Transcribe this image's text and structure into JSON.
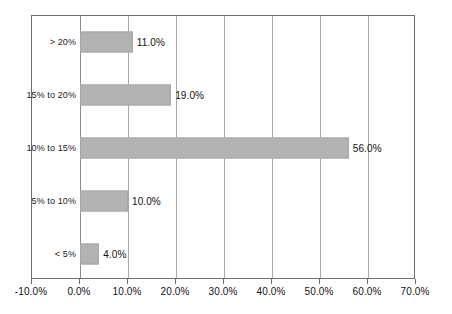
{
  "chart_data": {
    "type": "bar",
    "orientation": "horizontal",
    "title": "",
    "subtitle": "",
    "xlabel": "",
    "ylabel": "",
    "categories": [
      "< 5%",
      "5% to 10%",
      "10% to 15%",
      "15% to 20%",
      "> 20%"
    ],
    "values": [
      4.0,
      10.0,
      56.0,
      19.0,
      11.0
    ],
    "value_labels": [
      "4.0%",
      "10.0%",
      "56.0%",
      "19.0%",
      "11.0%"
    ],
    "xlim": [
      -10.0,
      70.0
    ],
    "xticks": [
      -10.0,
      0.0,
      10.0,
      20.0,
      30.0,
      40.0,
      50.0,
      60.0,
      70.0
    ],
    "xtick_labels": [
      "-10.0%",
      "0.0%",
      "10.0%",
      "20.0%",
      "30.0%",
      "40.0%",
      "50.0%",
      "60.0%",
      "70.0%"
    ],
    "grid": true,
    "grid_axis": "x",
    "legend": false,
    "legend_position": "none",
    "bar_color": "#b2b2b2",
    "bar_border_color": "#a6a6a6",
    "grid_color": "#a8a8a8",
    "axis_color": "#6e6e6e",
    "text_color": "#111111",
    "background_color": "#ffffff",
    "series": [
      {
        "name": "",
        "points": [
          {
            "category": "> 20%",
            "value": 11.0,
            "label": "11.0%"
          },
          {
            "category": "15% to 20%",
            "value": 19.0,
            "label": "19.0%"
          },
          {
            "category": "10% to 15%",
            "value": 56.0,
            "label": "56.0%"
          },
          {
            "category": "5% to 10%",
            "value": 10.0,
            "label": "10.0%"
          },
          {
            "category": "< 5%",
            "value": 4.0,
            "label": "4.0%"
          }
        ]
      }
    ]
  }
}
